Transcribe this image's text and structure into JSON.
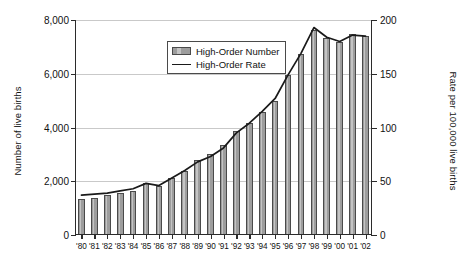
{
  "chart_data": {
    "type": "bar",
    "title": "",
    "subtitle": "",
    "xlabel": "",
    "ylabel": "Number of live births",
    "y2label": "Rate per 100,000 live births",
    "ylim": [
      0,
      8000
    ],
    "y2lim": [
      0,
      200
    ],
    "yticks": [
      "0",
      "2,000",
      "4,000",
      "6,000",
      "8,000"
    ],
    "ytick_values": [
      0,
      2000,
      4000,
      6000,
      8000
    ],
    "y2ticks": [
      "0",
      "50",
      "100",
      "150",
      "200"
    ],
    "y2tick_values": [
      0,
      50,
      100,
      150,
      200
    ],
    "grid": "horizontal",
    "legend_position": "top-left-inside",
    "categories": [
      "'80",
      "'81",
      "'82",
      "'83",
      "'84",
      "'85",
      "'86",
      "'87",
      "'88",
      "'89",
      "'90",
      "'91",
      "'92",
      "'93",
      "'94",
      "'95",
      "'96",
      "'97",
      "'98",
      "'99",
      "'00",
      "'01",
      "'02"
    ],
    "series": [
      {
        "name": "High-Order Number",
        "type": "bar",
        "axis": "left",
        "color": "#9d9d9d",
        "values": [
          1337,
          1385,
          1484,
          1575,
          1632,
          1925,
          1814,
          2120,
          2385,
          2798,
          3028,
          3346,
          3883,
          4168,
          4594,
          4973,
          5939,
          6737,
          7625,
          7321,
          7190,
          7471,
          7401
        ]
      },
      {
        "name": "High-Order Rate",
        "type": "line",
        "axis": "right",
        "color": "#1a1a1a",
        "values": [
          37,
          38,
          39,
          41,
          43,
          48,
          46,
          53,
          60,
          68,
          73,
          81,
          95,
          104,
          115,
          127,
          149,
          169,
          193,
          184,
          180,
          186,
          185
        ]
      }
    ]
  },
  "legend": {
    "items": [
      {
        "label": "High-Order Number",
        "marker": "bar-swatch"
      },
      {
        "label": "High-Order Rate",
        "marker": "line-swatch"
      }
    ]
  }
}
